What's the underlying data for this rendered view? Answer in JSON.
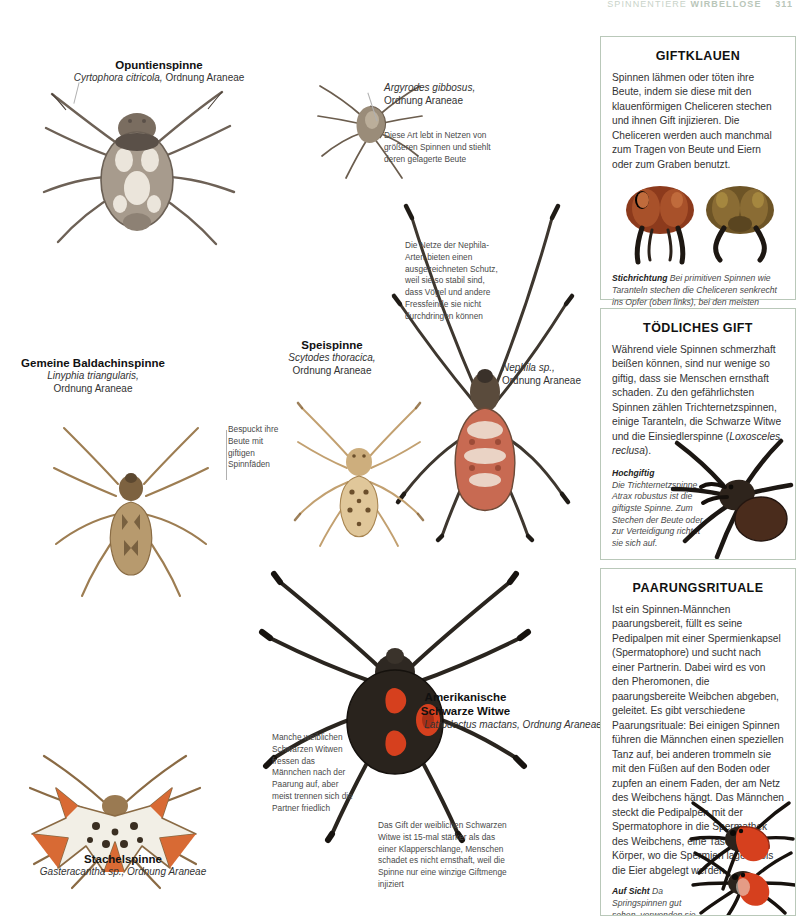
{
  "runhead": {
    "section": "SPINNENTIERE",
    "topic": "WIRBELLOSE",
    "page": "311"
  },
  "plate": {
    "labels": [
      {
        "id": "opuntienspinne",
        "common": "Opuntienspinne",
        "scientific": "Cyrtophora citricola,",
        "order": "Ordnung Araneae"
      },
      {
        "id": "argyrodes",
        "common": "",
        "scientific": "Argyrodes gibbosus,",
        "order": "Ordnung Araneae"
      },
      {
        "id": "baldachinspinne",
        "common": "Gemeine Baldachinspinne",
        "scientific": "Linyphia triangularis,",
        "order": "Ordnung Araneae"
      },
      {
        "id": "speispinne",
        "common": "Speispinne",
        "scientific": "Scytodes thoracica,",
        "order": "Ordnung Araneae"
      },
      {
        "id": "nephila",
        "common": "",
        "scientific": "Nephila sp.,",
        "order": "Ordnung Araneae"
      },
      {
        "id": "schwarze-witwe",
        "common": "Amerikanische Schwarze Witwe",
        "scientific": "Latrodectus mactans, Ordnung Araneae",
        "order": ""
      },
      {
        "id": "stachelspinne",
        "common": "Stachelspinne",
        "scientific": "Gasteracantha sp., Ordnung Araneae",
        "order": ""
      }
    ],
    "notes": [
      {
        "id": "argyrodes-note",
        "text": "Diese Art lebt in Netzen von größeren Spinnen und stiehlt deren gelagerte Beute"
      },
      {
        "id": "nephila-net-note",
        "text": "Die Netze der Nephila-Arten bieten einen ausgezeichneten Schutz, weil sie so stabil sind, dass Vögel und andere Fressfeinde sie nicht durchdringen können"
      },
      {
        "id": "speispinne-note",
        "text": "Bespuckt ihre Beute mit giftigen Spinnfäden"
      },
      {
        "id": "witwe-kannibalismus-note",
        "text": "Manche weiblichen Schwarzen Witwen fressen das Männchen nach der Paarung auf, aber meist trennen sich die Partner friedlich"
      },
      {
        "id": "witwe-gift-note",
        "text": "Das Gift der weiblichen Schwarzen Witwe ist 15-mal stärker als das einer Klapperschlange, Menschen schadet es nicht ernsthaft, weil die Spinne nur eine winzige Giftmenge injiziert"
      }
    ]
  },
  "panels": [
    {
      "id": "giftklauen",
      "title": "GIFTKLAUEN",
      "body": "Spinnen lähmen oder töten ihre Beute, indem sie diese mit den klauenförmigen Cheliceren stechen und ihnen Gift injizieren. Die Cheliceren werden auch manchmal zum Tragen von Beute und Eiern oder zum Graben benutzt.",
      "caption_lead": "Stichrichtung",
      "caption_text": " Bei primitiven Spinnen wie Taranteln stechen die Cheliceren senkrecht ins Opfer (oben links), bei den meisten anderen Arten schließen sie zangenartig (oben rechts)."
    },
    {
      "id": "toedliches-gift",
      "title": "TÖDLICHES GIFT",
      "body_a": "Während viele Spinnen schmerzhaft beißen können, sind nur wenige so giftig, dass sie Menschen ernsthaft schaden. Zu den gefährlichsten Spinnen zählen Trichternetzspinnen, einige Taranteln, die Schwarze Witwe und die Einsiedlerspinne (",
      "body_species": "Loxosceles reclusa",
      "body_b": ").",
      "caption_lead": "Hochgiftig",
      "caption_text": "Die Trichternetzspinne Atrax robustus ist die giftigste Spinne. Zum Stechen der Beute oder zur Verteidigung richtet sie sich auf."
    },
    {
      "id": "paarungsrituale",
      "title": "PAARUNGSRITUALE",
      "body": "Ist ein Spinnen-Männchen paarungsbereit, füllt es seine Pedipalpen mit einer Spermienkapsel (Spermatophore) und sucht nach einer Partnerin. Dabei wird es von den Pheromonen, die paarungsbereite Weibchen abgeben, geleitet. Es gibt verschiedene Paarungsrituale: Bei einigen Spinnen führen die Männchen einen speziellen Tanz auf, bei anderen trommeln sie mit den Füßen auf den Boden oder zupfen an einem Faden, der am Netz des Weibchens hängt. Das Männchen steckt die Pedipalpen mit der Spermatophore in die Spermathek des Weibchens, eine Tasche im Körper, wo die Spermien lagern, bis die Eier abgelegt werden.",
      "caption_lead": "Auf Sicht",
      "caption_text": " Da Springspinnen gut sehen, verwenden sie bei der Werbung visuelle Signale: Das Männchen vollführt einen komplizierten Tanz."
    }
  ],
  "colors": {
    "panel_border": "#b9c8b9",
    "body_text": "#333333",
    "caption_text": "#4a4a4a",
    "widow_red": "#d6401e",
    "spider_brown": "#8a6a44"
  }
}
